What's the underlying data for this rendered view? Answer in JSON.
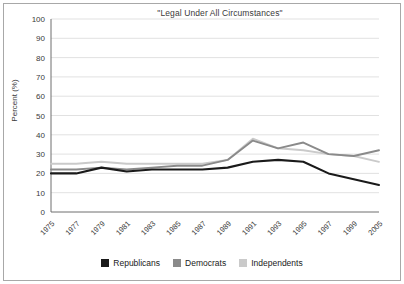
{
  "chart_data": {
    "type": "line",
    "title": "\"Legal Under All Circumstances\"",
    "xlabel": "",
    "ylabel": "Percent (%)",
    "ylim": [
      0,
      100
    ],
    "ytick_step": 10,
    "yticks": [
      0,
      10,
      20,
      30,
      40,
      50,
      60,
      70,
      80,
      90,
      100
    ],
    "grid": true,
    "legend_position": "bottom",
    "categories": [
      "1975",
      "1977",
      "1979",
      "1981",
      "1983",
      "1985",
      "1987",
      "1989",
      "1991",
      "1993",
      "1995",
      "1997",
      "1999",
      "2005"
    ],
    "series": [
      {
        "name": "Republicans",
        "color": "#1a1a1a",
        "values": [
          20,
          20,
          23,
          21,
          22,
          22,
          22,
          23,
          26,
          27,
          26,
          20,
          17,
          14
        ]
      },
      {
        "name": "Democrats",
        "color": "#8a8a8a",
        "values": [
          22,
          22,
          23,
          22,
          23,
          24,
          24,
          27,
          37,
          33,
          36,
          30,
          29,
          32
        ]
      },
      {
        "name": "Independents",
        "color": "#cacaca",
        "values": [
          25,
          25,
          26,
          25,
          25,
          25,
          25,
          27,
          38,
          33,
          32,
          30,
          29,
          26
        ]
      }
    ]
  },
  "legend": {
    "items": [
      {
        "label": "Republicans",
        "color": "#1a1a1a"
      },
      {
        "label": "Democrats",
        "color": "#8a8a8a"
      },
      {
        "label": "Independents",
        "color": "#cacaca"
      }
    ]
  },
  "colors": {
    "republicans": "#1a1a1a",
    "democrats": "#8a8a8a",
    "independents": "#cacaca",
    "gridline": "#d9d9d9",
    "axis": "#6e6e6e",
    "frame": "#a8a8a8",
    "text": "#3a3a3a"
  }
}
